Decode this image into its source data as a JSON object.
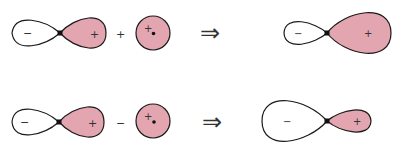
{
  "colors": {
    "fill": "#e3a6b0",
    "outline": "#1a1a1a",
    "background": "#ffffff"
  },
  "rows": [
    {
      "name": "bonding-combination",
      "operator": "+",
      "result_arrow": "⇒",
      "p_orbital": {
        "neg_label": "−",
        "pos_label": "+"
      },
      "s_orbital": {
        "label": "+"
      },
      "hybrid": {
        "neg_label": "−",
        "pos_label": "+",
        "larger_lobe": "positive"
      }
    },
    {
      "name": "antibonding-combination",
      "operator": "−",
      "result_arrow": "⇒",
      "p_orbital": {
        "neg_label": "−",
        "pos_label": "+"
      },
      "s_orbital": {
        "label": "+"
      },
      "hybrid": {
        "neg_label": "−",
        "pos_label": "+",
        "larger_lobe": "negative"
      }
    }
  ]
}
